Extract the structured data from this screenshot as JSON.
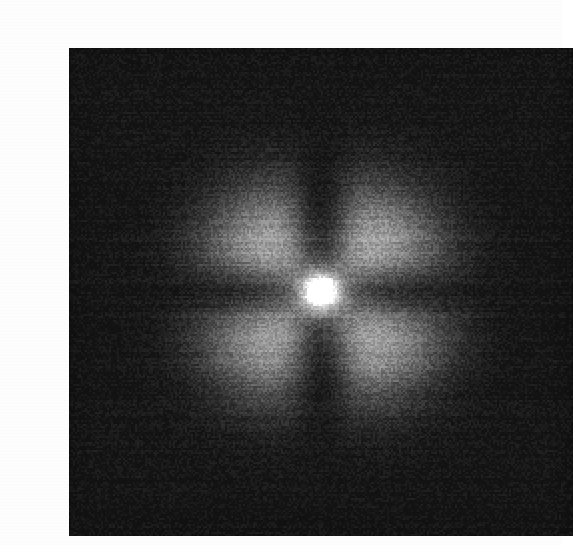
{
  "page": {
    "background_color": "#fdfdfd",
    "width": 562,
    "height": 545
  },
  "figure": {
    "caption": "",
    "alt_text": "Grayscale two-dimensional intensity map: a bright white core at the centre, four broad bright lobes in the diagonal quadrants, dark nodal bands along the vertical and horizontal axes, and near-black corners. Heavy film-grain noise with faint horizontal scan lines.",
    "plate": {
      "left": 29,
      "top": 32,
      "width": 504,
      "height": 488,
      "border_color": "#1a1a1a"
    }
  },
  "chart_data": {
    "type": "heatmap",
    "title": "",
    "subtitle": "",
    "xlabel": "",
    "ylabel": "",
    "colormap": "grayscale",
    "colormap_stops": [
      {
        "value": 0.0,
        "color": "#121212"
      },
      {
        "value": 0.18,
        "color": "#262626"
      },
      {
        "value": 0.35,
        "color": "#454545"
      },
      {
        "value": 0.52,
        "color": "#6e6e6e"
      },
      {
        "value": 0.68,
        "color": "#9a9a9a"
      },
      {
        "value": 0.82,
        "color": "#bdbdbd"
      },
      {
        "value": 0.92,
        "color": "#dcdcdc"
      },
      {
        "value": 1.0,
        "color": "#ffffff"
      }
    ],
    "grid": false,
    "legend": "none",
    "axis_ticks": "none",
    "xlim": [
      -1.0,
      1.0
    ],
    "ylim": [
      -1.0,
      1.0
    ],
    "grid_size": [
      504,
      488
    ],
    "center": {
      "x": 283,
      "y": 274
    },
    "peak_value": 1.0,
    "background_value": 0.06,
    "noise": {
      "kind": "film-grain",
      "amplitude": 0.085,
      "scanline_amplitude": 0.035,
      "seed": 20240517
    },
    "model": {
      "description": "Separable sinc-squared / diffraction-like envelope: I(x,y) = peak * env(r) * |f(u)|^2 * |f(v)|^2 with a radial Gaussian taper, producing a bright central core, a dark nodal cross along the axes, and four diagonal side lobes.",
      "core": {
        "name": "central-core",
        "cx": 0.0,
        "cy": 0.0,
        "peak": 1.0,
        "sigma": 0.055
      },
      "nodal_bands": [
        {
          "name": "vertical-nodal-band",
          "axis": "x",
          "position": 0.0,
          "half_width": 0.075,
          "depth": 0.88
        },
        {
          "name": "horizontal-nodal-band",
          "axis": "y",
          "position": 0.0,
          "half_width": 0.07,
          "depth": 0.74
        }
      ],
      "lobes": [
        {
          "name": "upper-left-lobe",
          "cx": -0.27,
          "cy": 0.25,
          "peak": 0.7,
          "sigma_x": 0.2,
          "sigma_y": 0.19
        },
        {
          "name": "upper-right-lobe",
          "cx": 0.28,
          "cy": 0.25,
          "peak": 0.71,
          "sigma_x": 0.2,
          "sigma_y": 0.19
        },
        {
          "name": "lower-left-lobe",
          "cx": -0.27,
          "cy": -0.26,
          "peak": 0.69,
          "sigma_x": 0.2,
          "sigma_y": 0.19
        },
        {
          "name": "lower-right-lobe",
          "cx": 0.28,
          "cy": -0.26,
          "peak": 0.72,
          "sigma_x": 0.2,
          "sigma_y": 0.19
        }
      ],
      "secondary_lobes": [
        {
          "name": "upper-mid-lobe",
          "cx": 0.0,
          "cy": 0.47,
          "peak": 0.16,
          "sigma_x": 0.22,
          "sigma_y": 0.14
        },
        {
          "name": "lower-mid-lobe",
          "cx": 0.0,
          "cy": -0.5,
          "peak": 0.14,
          "sigma_x": 0.22,
          "sigma_y": 0.14
        },
        {
          "name": "left-mid-lobe",
          "cx": -0.52,
          "cy": 0.0,
          "peak": 0.17,
          "sigma_x": 0.14,
          "sigma_y": 0.22
        },
        {
          "name": "right-mid-lobe",
          "cx": 0.53,
          "cy": 0.0,
          "peak": 0.22,
          "sigma_x": 0.14,
          "sigma_y": 0.22
        }
      ],
      "envelope": {
        "name": "radial-gaussian-taper",
        "sigma": 0.46,
        "floor": 0.045
      }
    },
    "sampled_profile_horizontal": {
      "note": "Normalised intensity sampled along y = 0 (centre row), x from -1 to 1.",
      "x": [
        -1.0,
        -0.9,
        -0.8,
        -0.7,
        -0.6,
        -0.5,
        -0.4,
        -0.3,
        -0.2,
        -0.1,
        0.0,
        0.1,
        0.2,
        0.3,
        0.4,
        0.5,
        0.6,
        0.7,
        0.8,
        0.9,
        1.0
      ],
      "values": [
        0.06,
        0.07,
        0.09,
        0.12,
        0.16,
        0.2,
        0.22,
        0.24,
        0.3,
        0.58,
        1.0,
        0.6,
        0.32,
        0.26,
        0.24,
        0.24,
        0.21,
        0.16,
        0.12,
        0.09,
        0.07
      ]
    },
    "sampled_profile_vertical": {
      "note": "Normalised intensity sampled along x = 0 (centre column), y from -1 (bottom) to 1 (top).",
      "y": [
        -1.0,
        -0.9,
        -0.8,
        -0.7,
        -0.6,
        -0.5,
        -0.4,
        -0.3,
        -0.2,
        -0.1,
        0.0,
        0.1,
        0.2,
        0.3,
        0.4,
        0.5,
        0.6,
        0.7,
        0.8,
        0.9,
        1.0
      ],
      "values": [
        0.06,
        0.07,
        0.08,
        0.1,
        0.12,
        0.14,
        0.13,
        0.12,
        0.22,
        0.55,
        1.0,
        0.52,
        0.18,
        0.11,
        0.12,
        0.14,
        0.13,
        0.11,
        0.08,
        0.07,
        0.06
      ]
    },
    "sampled_profile_diagonal": {
      "note": "Normalised intensity along the lower-left / upper-right diagonal, t from -1 to 1.",
      "t": [
        -1.0,
        -0.8,
        -0.6,
        -0.45,
        -0.35,
        -0.25,
        -0.15,
        0.0,
        0.15,
        0.25,
        0.35,
        0.45,
        0.6,
        0.8,
        1.0
      ],
      "values": [
        0.06,
        0.12,
        0.34,
        0.62,
        0.7,
        0.64,
        0.62,
        1.0,
        0.63,
        0.66,
        0.72,
        0.63,
        0.35,
        0.13,
        0.07
      ]
    },
    "region_intensities": [
      {
        "region": "center-core",
        "value": 1.0,
        "hex": "#ffffff"
      },
      {
        "region": "upper-left-lobe",
        "value": 0.7,
        "hex": "#b2b2b2"
      },
      {
        "region": "upper-right-lobe",
        "value": 0.71,
        "hex": "#b5b5b5"
      },
      {
        "region": "lower-left-lobe",
        "value": 0.69,
        "hex": "#b0b0b0"
      },
      {
        "region": "lower-right-lobe",
        "value": 0.72,
        "hex": "#b8b8b8"
      },
      {
        "region": "vertical-nodal-band",
        "value": 0.12,
        "hex": "#232323"
      },
      {
        "region": "horizontal-nodal-band",
        "value": 0.2,
        "hex": "#353535"
      },
      {
        "region": "top-left-corner",
        "value": 0.06,
        "hex": "#1a1a1a"
      },
      {
        "region": "top-right-corner",
        "value": 0.06,
        "hex": "#1a1a1a"
      },
      {
        "region": "bottom-left-corner",
        "value": 0.06,
        "hex": "#191919"
      },
      {
        "region": "bottom-right-corner",
        "value": 0.05,
        "hex": "#171717"
      }
    ]
  }
}
